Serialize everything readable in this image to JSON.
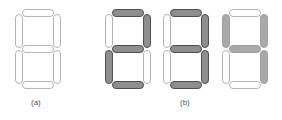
{
  "figure": {
    "labels": {
      "a": "(a)",
      "b": "(b)"
    },
    "colors": {
      "outline": "#b4b4b4",
      "on_dark_fill": "#8e8e8e",
      "on_dark_border": "#505050",
      "on_light_fill": "#a9a9a9"
    },
    "digits": [
      {
        "id": "blank",
        "group": "a",
        "style": "outline",
        "segments_on": []
      },
      {
        "id": "two",
        "group": "b",
        "style": "dark",
        "segments_on": [
          "a",
          "b",
          "g",
          "e",
          "d"
        ]
      },
      {
        "id": "three",
        "group": "b",
        "style": "dark",
        "segments_on": [
          "a",
          "b",
          "g",
          "c",
          "d"
        ]
      },
      {
        "id": "four",
        "group": "b",
        "style": "light",
        "segments_on": [
          "f",
          "b",
          "g",
          "c"
        ]
      }
    ]
  }
}
